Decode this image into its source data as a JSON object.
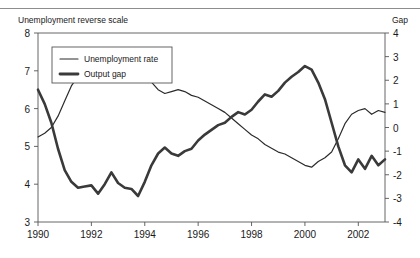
{
  "figure": {
    "left_axis_title": "Unemployment reverse scale",
    "right_axis_title": "Gap",
    "caption_ghost": ""
  },
  "legend": {
    "items": [
      {
        "label": "Unemployment rate",
        "style": "thin",
        "color": "#2b2b2b"
      },
      {
        "label": "Output gap",
        "style": "thick",
        "color": "#3a3a3a"
      }
    ]
  },
  "chart_data": {
    "type": "line",
    "title": "",
    "subtitle": "",
    "xlabel": "",
    "ylabel": "Unemployment reverse scale",
    "y2label": "Gap",
    "grid": false,
    "legend_position": "top-left",
    "xlim": [
      1990,
      2003
    ],
    "ylim": [
      8,
      3
    ],
    "y_inverted": true,
    "y2lim": [
      -4,
      4
    ],
    "yticks": [
      3,
      4,
      5,
      6,
      7,
      8
    ],
    "ytick_labels": [
      "3",
      "4",
      "5",
      "6",
      "7",
      "8"
    ],
    "y2ticks": [
      4,
      3,
      2,
      1,
      0,
      -1,
      -2,
      -3,
      -4
    ],
    "y2tick_labels": [
      "4",
      "3",
      "2",
      "1",
      "0",
      "-1",
      "-2",
      "-3",
      "-4"
    ],
    "xticks": [
      1990,
      1992,
      1994,
      1996,
      1998,
      2000,
      2002
    ],
    "xtick_labels": [
      "1990",
      "1992",
      "1994",
      "1996",
      "1998",
      "2000",
      "2002"
    ],
    "series": [
      {
        "name": "Unemployment rate",
        "axis": "left",
        "units": "percent (reverse scale)",
        "x": [
          1990.0,
          1990.25,
          1990.5,
          1990.75,
          1991.0,
          1991.25,
          1991.5,
          1991.75,
          1992.0,
          1992.25,
          1992.5,
          1992.75,
          1993.0,
          1993.25,
          1993.5,
          1993.75,
          1994.0,
          1994.25,
          1994.5,
          1994.75,
          1995.0,
          1995.25,
          1995.5,
          1995.75,
          1996.0,
          1996.25,
          1996.5,
          1996.75,
          1997.0,
          1997.25,
          1997.5,
          1997.75,
          1998.0,
          1998.25,
          1998.5,
          1998.75,
          1999.0,
          1999.25,
          1999.5,
          1999.75,
          2000.0,
          2000.25,
          2000.5,
          2000.75,
          2001.0,
          2001.25,
          2001.5,
          2001.75,
          2002.0,
          2002.25,
          2002.5,
          2002.75,
          2003.0
        ],
        "values": [
          5.25,
          5.35,
          5.5,
          5.8,
          6.2,
          6.6,
          6.85,
          7.0,
          7.1,
          7.25,
          7.3,
          7.35,
          7.3,
          7.15,
          7.1,
          7.05,
          6.9,
          6.7,
          6.5,
          6.4,
          6.45,
          6.5,
          6.45,
          6.35,
          6.3,
          6.2,
          6.1,
          6.0,
          5.9,
          5.75,
          5.6,
          5.45,
          5.3,
          5.2,
          5.05,
          4.95,
          4.85,
          4.8,
          4.7,
          4.6,
          4.5,
          4.45,
          4.6,
          4.7,
          4.85,
          5.2,
          5.6,
          5.85,
          5.95,
          6.0,
          5.85,
          5.95,
          5.9
        ]
      },
      {
        "name": "Output gap",
        "axis": "right",
        "units": "percent of potential GDP",
        "x": [
          1990.0,
          1990.25,
          1990.5,
          1990.75,
          1991.0,
          1991.25,
          1991.5,
          1991.75,
          1992.0,
          1992.25,
          1992.5,
          1992.75,
          1993.0,
          1993.25,
          1993.5,
          1993.75,
          1994.0,
          1994.25,
          1994.5,
          1994.75,
          1995.0,
          1995.25,
          1995.5,
          1995.75,
          1996.0,
          1996.25,
          1996.5,
          1996.75,
          1997.0,
          1997.25,
          1997.5,
          1997.75,
          1998.0,
          1998.25,
          1998.5,
          1998.75,
          1999.0,
          1999.25,
          1999.5,
          1999.75,
          2000.0,
          2000.25,
          2000.5,
          2000.75,
          2001.0,
          2001.25,
          2001.5,
          2001.75,
          2002.0,
          2002.25,
          2002.5,
          2002.75,
          2003.0
        ],
        "values": [
          1.6,
          1.0,
          0.2,
          -0.9,
          -1.8,
          -2.3,
          -2.55,
          -2.5,
          -2.45,
          -2.8,
          -2.4,
          -1.9,
          -2.35,
          -2.55,
          -2.6,
          -2.9,
          -2.3,
          -1.6,
          -1.1,
          -0.85,
          -1.1,
          -1.2,
          -1.0,
          -0.9,
          -0.55,
          -0.3,
          -0.1,
          0.1,
          0.2,
          0.45,
          0.65,
          0.55,
          0.75,
          1.1,
          1.4,
          1.3,
          1.55,
          1.9,
          2.15,
          2.35,
          2.6,
          2.45,
          1.9,
          1.2,
          0.2,
          -0.8,
          -1.6,
          -1.9,
          -1.35,
          -1.75,
          -1.2,
          -1.6,
          -1.35
        ]
      }
    ],
    "annotations": []
  }
}
